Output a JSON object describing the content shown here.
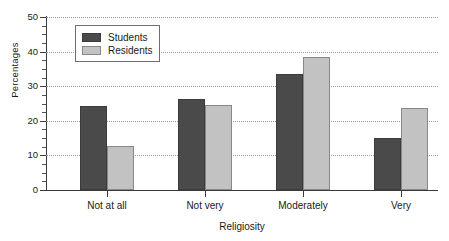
{
  "chart_data": {
    "type": "bar",
    "title": "",
    "xlabel": "Religiosity",
    "ylabel": "Percentages",
    "categories": [
      "Not at all",
      "Not very",
      "Moderately",
      "Very"
    ],
    "series": [
      {
        "name": "Students",
        "color": "#4a4a4a",
        "values": [
          24.3,
          26.3,
          33.6,
          15.1
        ]
      },
      {
        "name": "Residents",
        "color": "#c2c2c2",
        "values": [
          12.6,
          24.5,
          38.5,
          23.6
        ]
      }
    ],
    "ylim": [
      0,
      50
    ],
    "ytick_labels": [
      "0",
      "10",
      "20",
      "30",
      "40",
      "50"
    ],
    "ytick_values": [
      0,
      10,
      20,
      30,
      40,
      50
    ],
    "yminor_step": 2.5,
    "grid": "horizontal-dotted",
    "legend_position": "top-left"
  },
  "legend": {
    "entries": [
      {
        "label": "Students"
      },
      {
        "label": "Residents"
      }
    ]
  },
  "axes": {
    "y_title": "Percentages",
    "x_title": "Religiosity"
  }
}
